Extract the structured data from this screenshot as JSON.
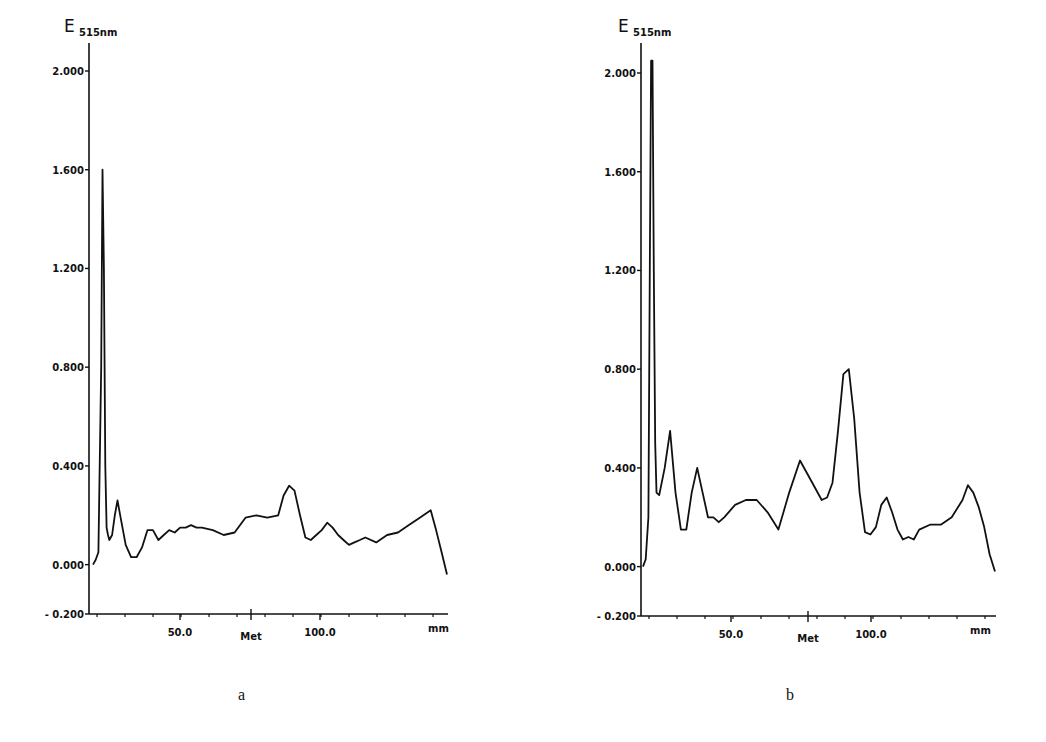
{
  "chart_data": [
    {
      "id": "a",
      "type": "line",
      "caption": "a",
      "title": "",
      "ylabel_main": "E",
      "ylabel_sub": "515nm",
      "xlabel": "mm",
      "ylim": [
        -0.2,
        2.0
      ],
      "yticks": [
        "2.000",
        "1.600",
        "1.200",
        "0.800",
        "0.400",
        "0.000",
        "-0.200"
      ],
      "xticks": [
        {
          "label": "50.0",
          "x": 50
        },
        {
          "label": "Met",
          "x": 75
        },
        {
          "label": "100.0",
          "x": 100
        }
      ],
      "x_unit_label": "mm",
      "xlim": [
        0,
        130
      ],
      "grid": false,
      "series": [
        {
          "name": "absorbance",
          "x": [
            0,
            1,
            2,
            3,
            3.5,
            4,
            4.5,
            5,
            5.5,
            6,
            7,
            8,
            9,
            10,
            12,
            14,
            16,
            18,
            20,
            22,
            24,
            26,
            28,
            30,
            32,
            34,
            36,
            38,
            40,
            44,
            48,
            52,
            56,
            60,
            64,
            68,
            70,
            72,
            74,
            76,
            78,
            80,
            82,
            84,
            86,
            88,
            90,
            92,
            94,
            96,
            98,
            100,
            104,
            108,
            112,
            116,
            120,
            124,
            126,
            128,
            130
          ],
          "y": [
            0.0,
            0.02,
            0.05,
            0.8,
            1.6,
            1.2,
            0.4,
            0.15,
            0.12,
            0.1,
            0.12,
            0.2,
            0.26,
            0.2,
            0.08,
            0.03,
            0.03,
            0.07,
            0.14,
            0.14,
            0.1,
            0.12,
            0.14,
            0.13,
            0.15,
            0.15,
            0.16,
            0.15,
            0.15,
            0.14,
            0.12,
            0.13,
            0.19,
            0.2,
            0.19,
            0.2,
            0.28,
            0.32,
            0.3,
            0.2,
            0.11,
            0.1,
            0.12,
            0.14,
            0.17,
            0.15,
            0.12,
            0.1,
            0.08,
            0.09,
            0.1,
            0.11,
            0.09,
            0.12,
            0.13,
            0.16,
            0.19,
            0.22,
            0.14,
            0.05,
            -0.04
          ]
        }
      ]
    },
    {
      "id": "b",
      "type": "line",
      "caption": "b",
      "title": "",
      "ylabel_main": "E",
      "ylabel_sub": "515nm",
      "xlabel": "mm",
      "ylim": [
        -0.2,
        2.0
      ],
      "yticks": [
        "2.000",
        "1.600",
        "1.200",
        "0.800",
        "0.400",
        "0.000",
        "-0.200"
      ],
      "xticks": [
        {
          "label": "50.0",
          "x": 50
        },
        {
          "label": "Met",
          "x": 78
        },
        {
          "label": "100.0",
          "x": 100
        }
      ],
      "x_unit_label": "mm",
      "xlim": [
        0,
        130
      ],
      "grid": false,
      "series": [
        {
          "name": "absorbance",
          "x": [
            0,
            1,
            2,
            2.5,
            3,
            3.5,
            4,
            4.5,
            5,
            6,
            8,
            10,
            12,
            14,
            16,
            18,
            20,
            22,
            24,
            26,
            28,
            30,
            34,
            38,
            42,
            46,
            50,
            54,
            58,
            62,
            66,
            68,
            70,
            72,
            74,
            76,
            78,
            80,
            82,
            84,
            86,
            88,
            90,
            92,
            94,
            96,
            98,
            100,
            102,
            106,
            110,
            114,
            118,
            120,
            122,
            124,
            126,
            128,
            130
          ],
          "y": [
            0.0,
            0.03,
            0.2,
            1.2,
            2.05,
            2.05,
            1.2,
            0.5,
            0.3,
            0.29,
            0.4,
            0.55,
            0.3,
            0.15,
            0.15,
            0.3,
            0.4,
            0.3,
            0.2,
            0.2,
            0.18,
            0.2,
            0.25,
            0.27,
            0.27,
            0.22,
            0.15,
            0.3,
            0.43,
            0.35,
            0.27,
            0.28,
            0.34,
            0.55,
            0.78,
            0.8,
            0.6,
            0.3,
            0.14,
            0.13,
            0.16,
            0.25,
            0.28,
            0.22,
            0.15,
            0.11,
            0.12,
            0.11,
            0.15,
            0.17,
            0.17,
            0.2,
            0.27,
            0.33,
            0.3,
            0.24,
            0.16,
            0.05,
            -0.02
          ]
        }
      ]
    }
  ],
  "captions": {
    "a": "a",
    "b": "b"
  },
  "axis": {
    "ylabel_main": "E",
    "ylabel_sub": "515nm",
    "x_unit": "mm",
    "marker_label": "Met"
  }
}
